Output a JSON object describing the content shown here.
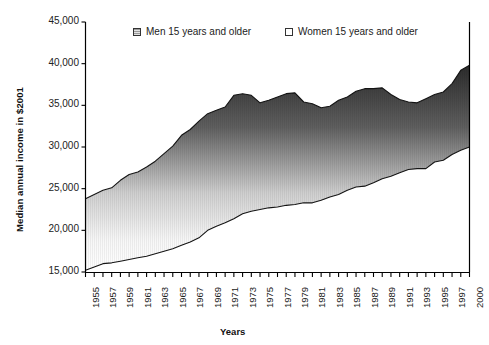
{
  "chart_data": {
    "type": "area",
    "title": "",
    "xlabel": "Years",
    "ylabel": "Median annual income in $2001",
    "ylim": [
      15000,
      45000
    ],
    "yticks": [
      15000,
      20000,
      25000,
      30000,
      35000,
      40000,
      45000
    ],
    "ytick_labels": [
      "15,000",
      "20,000",
      "25,000",
      "30,000",
      "35,000",
      "40,000",
      "45,000"
    ],
    "grid": false,
    "legend_position": "top-center",
    "x": [
      1955,
      1956,
      1957,
      1958,
      1959,
      1960,
      1961,
      1962,
      1963,
      1964,
      1965,
      1966,
      1967,
      1968,
      1969,
      1970,
      1971,
      1972,
      1973,
      1974,
      1975,
      1976,
      1977,
      1978,
      1979,
      1980,
      1981,
      1982,
      1983,
      1984,
      1985,
      1986,
      1987,
      1988,
      1989,
      1990,
      1991,
      1992,
      1993,
      1994,
      1995,
      1996,
      1997,
      2000,
      2001
    ],
    "xtick_labels": [
      "1955",
      "1957",
      "1959",
      "1961",
      "1963",
      "1965",
      "1967",
      "1969",
      "1971",
      "1973",
      "1975",
      "1977",
      "1979",
      "1981",
      "1983",
      "1985",
      "1987",
      "1989",
      "1991",
      "1993",
      "1995",
      "1997",
      "2000",
      "2001"
    ],
    "series": [
      {
        "name": "Men 15 years and older",
        "values": [
          23800,
          24300,
          24800,
          25100,
          26000,
          26700,
          27000,
          27600,
          28300,
          29200,
          30100,
          31400,
          32100,
          33100,
          34000,
          34400,
          34800,
          36200,
          36400,
          36200,
          35300,
          35600,
          36000,
          36400,
          36500,
          35400,
          35200,
          34700,
          34900,
          35600,
          36000,
          36700,
          37000,
          37000,
          37100,
          36300,
          35700,
          35400,
          35300,
          35800,
          36300,
          36600,
          37600,
          39200,
          39800
        ]
      },
      {
        "name": "Women 15 years and older",
        "values": [
          15200,
          15600,
          16000,
          16100,
          16300,
          16500,
          16700,
          16900,
          17200,
          17500,
          17800,
          18200,
          18600,
          19100,
          20000,
          20500,
          20900,
          21400,
          22000,
          22300,
          22500,
          22700,
          22800,
          23000,
          23100,
          23300,
          23300,
          23600,
          24000,
          24300,
          24800,
          25200,
          25300,
          25700,
          26200,
          26500,
          26900,
          27300,
          27400,
          27400,
          28200,
          28400,
          29100,
          29600,
          30000
        ]
      }
    ]
  },
  "legend": {
    "men_label": "Men 15 years and older",
    "women_label": "Women 15 years and older"
  },
  "axes": {
    "y_title": "Median annual income in $2001",
    "x_title": "Years"
  },
  "colors": {
    "men_fill_dark": "#3a3a3a",
    "men_fill_light": "#f2f2f2",
    "line": "#1a1a1a",
    "axis": "#000000",
    "text": "#222222"
  }
}
